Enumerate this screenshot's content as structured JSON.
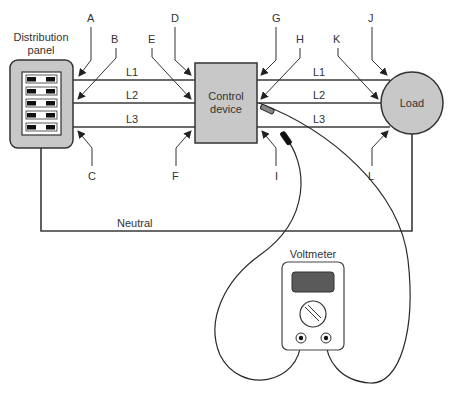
{
  "components": {
    "distribution_panel": {
      "label_line1": "Distribution",
      "label_line2": "panel",
      "breaker_rows": 5
    },
    "control_device": {
      "label_line1": "Control",
      "label_line2": "device"
    },
    "load": {
      "label": "Load"
    },
    "voltmeter": {
      "label": "Voltmeter"
    }
  },
  "lines": {
    "left": [
      "L1",
      "L2",
      "L3"
    ],
    "right": [
      "L1",
      "L2",
      "L3"
    ],
    "neutral": "Neutral"
  },
  "points": {
    "A": "A",
    "B": "B",
    "C": "C",
    "D": "D",
    "E": "E",
    "F": "F",
    "G": "G",
    "H": "H",
    "I": "I",
    "J": "J",
    "K": "K",
    "L": "L"
  },
  "colors": {
    "fill_gray": "#c8c8c8",
    "display": "#5a5a5a",
    "line": "#3a3a3a"
  }
}
